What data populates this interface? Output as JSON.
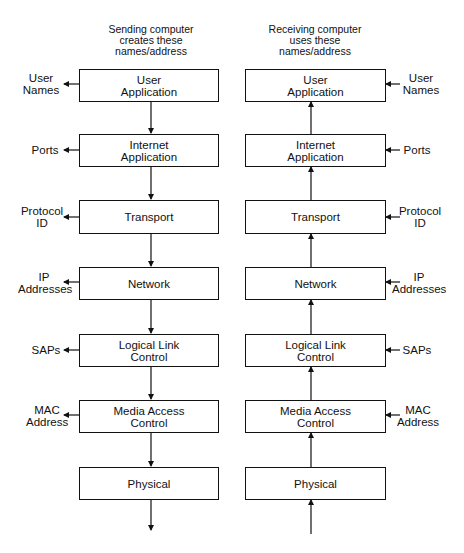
{
  "sending": {
    "header": [
      "Sending computer",
      "creates these",
      "names/address"
    ],
    "layers": [
      {
        "lines": [
          "User",
          "Application"
        ],
        "name_lines": [
          "User",
          "Names"
        ]
      },
      {
        "lines": [
          "Internet",
          "Application"
        ],
        "name_lines": [
          "Ports"
        ]
      },
      {
        "lines": [
          "Transport"
        ],
        "name_lines": [
          "Protocol",
          "ID"
        ]
      },
      {
        "lines": [
          "Network"
        ],
        "name_lines": [
          "IP",
          "Addresses"
        ]
      },
      {
        "lines": [
          "Logical Link",
          "Control"
        ],
        "name_lines": [
          "SAPs"
        ]
      },
      {
        "lines": [
          "Media Access",
          "Control"
        ],
        "name_lines": [
          "MAC",
          "Address"
        ]
      },
      {
        "lines": [
          "Physical"
        ],
        "name_lines": []
      }
    ],
    "flow_direction": "down"
  },
  "receiving": {
    "header": [
      "Receiving computer",
      "uses these",
      "names/address"
    ],
    "layers": [
      {
        "lines": [
          "User",
          "Application"
        ],
        "name_lines": [
          "User",
          "Names"
        ]
      },
      {
        "lines": [
          "Internet",
          "Application"
        ],
        "name_lines": [
          "Ports"
        ]
      },
      {
        "lines": [
          "Transport"
        ],
        "name_lines": [
          "Protocol",
          "ID"
        ]
      },
      {
        "lines": [
          "Network"
        ],
        "name_lines": [
          "IP",
          "Addresses"
        ]
      },
      {
        "lines": [
          "Logical Link",
          "Control"
        ],
        "name_lines": [
          "SAPs"
        ]
      },
      {
        "lines": [
          "Media Access",
          "Control"
        ],
        "name_lines": [
          "MAC",
          "Address"
        ]
      },
      {
        "lines": [
          "Physical"
        ],
        "name_lines": []
      }
    ],
    "flow_direction": "up"
  },
  "colors": {
    "line": "#111111",
    "background": "#ffffff"
  }
}
